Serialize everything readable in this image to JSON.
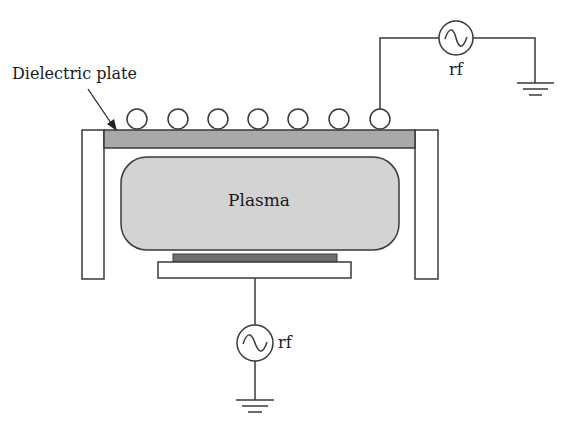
{
  "diagram": {
    "labels": {
      "dielectric_plate": "Dielectric plate",
      "plasma": "Plasma",
      "rf_top": "rf",
      "rf_bottom": "rf"
    },
    "components": [
      {
        "id": "chamber-wall-left",
        "type": "wall"
      },
      {
        "id": "chamber-wall-right",
        "type": "wall"
      },
      {
        "id": "dielectric-plate",
        "type": "dielectric window"
      },
      {
        "id": "coil-turns",
        "type": "planar coil",
        "count": 7
      },
      {
        "id": "plasma-region",
        "type": "plasma"
      },
      {
        "id": "substrate-electrode",
        "type": "electrode with wafer"
      },
      {
        "id": "rf-source-top",
        "type": "rf generator",
        "connected_to": "coil-turns"
      },
      {
        "id": "rf-source-bottom",
        "type": "rf generator",
        "connected_to": "substrate-electrode"
      },
      {
        "id": "ground-top",
        "type": "ground"
      },
      {
        "id": "ground-bottom",
        "type": "ground"
      }
    ],
    "colors": {
      "line": "#3a3a3a",
      "dielectric_fill": "#a9a9a9",
      "plasma_fill": "#d3d3d3",
      "wafer_fill": "#6e6e6e",
      "background": "#ffffff"
    }
  }
}
